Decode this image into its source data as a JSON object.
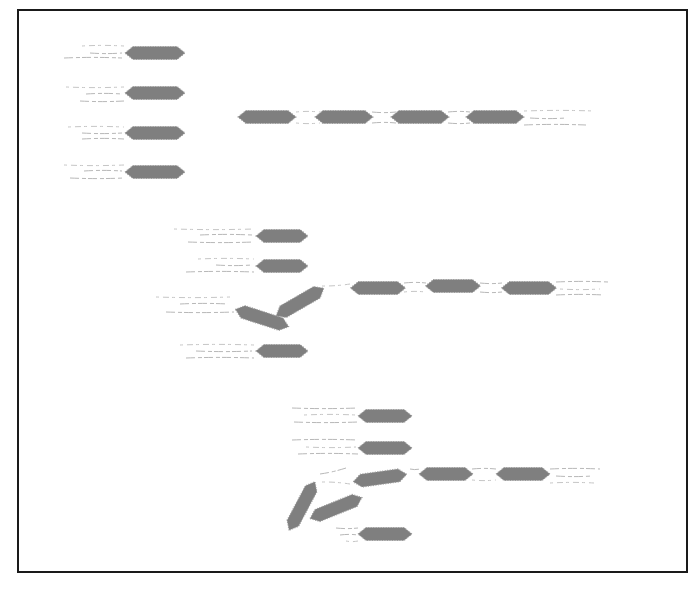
{
  "diagram": {
    "title": "",
    "frame": {
      "x": 17,
      "y": 9,
      "w": 670,
      "h": 563,
      "color": "#1a1a1a"
    },
    "block_color": "#7f7f7f",
    "label_color": "#b8b8b8",
    "note": "Labels rendered as faint illegible scribble lines; no readable text",
    "groups": [
      {
        "id": "group-1",
        "stack": [
          {
            "cx": 155,
            "cy": 53,
            "w": 60,
            "angle": 0
          },
          {
            "cx": 155,
            "cy": 93,
            "w": 60,
            "angle": 0
          },
          {
            "cx": 155,
            "cy": 133,
            "w": 60,
            "angle": 0
          },
          {
            "cx": 155,
            "cy": 172,
            "w": 60,
            "angle": 0
          }
        ],
        "chain": [
          {
            "cx": 267,
            "cy": 117,
            "w": 58,
            "angle": 0
          },
          {
            "cx": 344,
            "cy": 117,
            "w": 58,
            "angle": 0
          },
          {
            "cx": 420,
            "cy": 117,
            "w": 58,
            "angle": 0
          },
          {
            "cx": 495,
            "cy": 117,
            "w": 58,
            "angle": 0
          }
        ]
      },
      {
        "id": "group-2",
        "stack": [
          {
            "cx": 282,
            "cy": 236,
            "w": 52,
            "angle": 0
          },
          {
            "cx": 282,
            "cy": 266,
            "w": 52,
            "angle": 0
          },
          {
            "cx": 262,
            "cy": 318,
            "w": 56,
            "angle": 18
          },
          {
            "cx": 300,
            "cy": 302,
            "w": 55,
            "angle": -30
          },
          {
            "cx": 282,
            "cy": 351,
            "w": 52,
            "angle": 0
          }
        ],
        "chain": [
          {
            "cx": 378,
            "cy": 288,
            "w": 55,
            "angle": 0
          },
          {
            "cx": 453,
            "cy": 286,
            "w": 55,
            "angle": 0
          },
          {
            "cx": 529,
            "cy": 288,
            "w": 55,
            "angle": 0
          }
        ]
      },
      {
        "id": "group-3",
        "stack": [
          {
            "cx": 385,
            "cy": 416,
            "w": 54,
            "angle": 0
          },
          {
            "cx": 385,
            "cy": 448,
            "w": 54,
            "angle": 0
          },
          {
            "cx": 380,
            "cy": 478,
            "w": 54,
            "angle": -8
          },
          {
            "cx": 302,
            "cy": 506,
            "w": 55,
            "angle": -62
          },
          {
            "cx": 336,
            "cy": 508,
            "w": 56,
            "angle": -22
          },
          {
            "cx": 385,
            "cy": 534,
            "w": 54,
            "angle": 0
          }
        ],
        "chain": [
          {
            "cx": 446,
            "cy": 474,
            "w": 54,
            "angle": 0
          },
          {
            "cx": 523,
            "cy": 474,
            "w": 54,
            "angle": 0
          }
        ]
      }
    ],
    "label_lines": [
      {
        "x1": 82,
        "y1": 46,
        "x2": 124,
        "y2": 46
      },
      {
        "x1": 90,
        "y1": 53,
        "x2": 122,
        "y2": 53
      },
      {
        "x1": 64,
        "y1": 58,
        "x2": 122,
        "y2": 58
      },
      {
        "x1": 66,
        "y1": 87,
        "x2": 124,
        "y2": 87
      },
      {
        "x1": 86,
        "y1": 94,
        "x2": 122,
        "y2": 94
      },
      {
        "x1": 80,
        "y1": 101,
        "x2": 124,
        "y2": 101
      },
      {
        "x1": 68,
        "y1": 127,
        "x2": 124,
        "y2": 127
      },
      {
        "x1": 82,
        "y1": 133,
        "x2": 122,
        "y2": 133
      },
      {
        "x1": 82,
        "y1": 139,
        "x2": 124,
        "y2": 139
      },
      {
        "x1": 64,
        "y1": 165,
        "x2": 124,
        "y2": 165
      },
      {
        "x1": 84,
        "y1": 171,
        "x2": 122,
        "y2": 171
      },
      {
        "x1": 70,
        "y1": 178,
        "x2": 124,
        "y2": 178
      },
      {
        "x1": 296,
        "y1": 112,
        "x2": 320,
        "y2": 112
      },
      {
        "x1": 372,
        "y1": 112,
        "x2": 396,
        "y2": 112
      },
      {
        "x1": 448,
        "y1": 112,
        "x2": 470,
        "y2": 112
      },
      {
        "x1": 296,
        "y1": 123,
        "x2": 320,
        "y2": 123
      },
      {
        "x1": 372,
        "y1": 123,
        "x2": 396,
        "y2": 123
      },
      {
        "x1": 448,
        "y1": 123,
        "x2": 470,
        "y2": 123
      },
      {
        "x1": 524,
        "y1": 111,
        "x2": 594,
        "y2": 111
      },
      {
        "x1": 530,
        "y1": 118,
        "x2": 566,
        "y2": 118
      },
      {
        "x1": 524,
        "y1": 125,
        "x2": 586,
        "y2": 125
      },
      {
        "x1": 174,
        "y1": 229,
        "x2": 254,
        "y2": 229
      },
      {
        "x1": 200,
        "y1": 235,
        "x2": 252,
        "y2": 235
      },
      {
        "x1": 188,
        "y1": 242,
        "x2": 254,
        "y2": 242
      },
      {
        "x1": 198,
        "y1": 259,
        "x2": 254,
        "y2": 259
      },
      {
        "x1": 216,
        "y1": 265,
        "x2": 252,
        "y2": 265
      },
      {
        "x1": 186,
        "y1": 272,
        "x2": 254,
        "y2": 272
      },
      {
        "x1": 156,
        "y1": 297,
        "x2": 230,
        "y2": 297
      },
      {
        "x1": 180,
        "y1": 304,
        "x2": 228,
        "y2": 304
      },
      {
        "x1": 166,
        "y1": 312,
        "x2": 234,
        "y2": 312
      },
      {
        "x1": 180,
        "y1": 345,
        "x2": 254,
        "y2": 345
      },
      {
        "x1": 196,
        "y1": 351,
        "x2": 252,
        "y2": 351
      },
      {
        "x1": 186,
        "y1": 358,
        "x2": 254,
        "y2": 358
      },
      {
        "x1": 322,
        "y1": 286,
        "x2": 350,
        "y2": 284
      },
      {
        "x1": 404,
        "y1": 283,
        "x2": 426,
        "y2": 283
      },
      {
        "x1": 480,
        "y1": 283,
        "x2": 502,
        "y2": 283
      },
      {
        "x1": 404,
        "y1": 292,
        "x2": 426,
        "y2": 292
      },
      {
        "x1": 480,
        "y1": 292,
        "x2": 502,
        "y2": 292
      },
      {
        "x1": 556,
        "y1": 282,
        "x2": 608,
        "y2": 282
      },
      {
        "x1": 560,
        "y1": 289,
        "x2": 600,
        "y2": 289
      },
      {
        "x1": 556,
        "y1": 295,
        "x2": 604,
        "y2": 295
      },
      {
        "x1": 292,
        "y1": 408,
        "x2": 358,
        "y2": 408
      },
      {
        "x1": 304,
        "y1": 415,
        "x2": 356,
        "y2": 415
      },
      {
        "x1": 294,
        "y1": 422,
        "x2": 358,
        "y2": 422
      },
      {
        "x1": 292,
        "y1": 440,
        "x2": 358,
        "y2": 440
      },
      {
        "x1": 306,
        "y1": 447,
        "x2": 356,
        "y2": 447
      },
      {
        "x1": 298,
        "y1": 454,
        "x2": 358,
        "y2": 454
      },
      {
        "x1": 320,
        "y1": 474,
        "x2": 346,
        "y2": 468
      },
      {
        "x1": 322,
        "y1": 482,
        "x2": 350,
        "y2": 484
      },
      {
        "x1": 410,
        "y1": 469,
        "x2": 420,
        "y2": 469
      },
      {
        "x1": 472,
        "y1": 469,
        "x2": 496,
        "y2": 469
      },
      {
        "x1": 472,
        "y1": 480,
        "x2": 496,
        "y2": 480
      },
      {
        "x1": 550,
        "y1": 469,
        "x2": 600,
        "y2": 469
      },
      {
        "x1": 556,
        "y1": 476,
        "x2": 592,
        "y2": 476
      },
      {
        "x1": 550,
        "y1": 483,
        "x2": 594,
        "y2": 483
      },
      {
        "x1": 336,
        "y1": 528,
        "x2": 358,
        "y2": 528
      },
      {
        "x1": 340,
        "y1": 535,
        "x2": 358,
        "y2": 535
      },
      {
        "x1": 346,
        "y1": 541,
        "x2": 358,
        "y2": 541
      }
    ]
  }
}
